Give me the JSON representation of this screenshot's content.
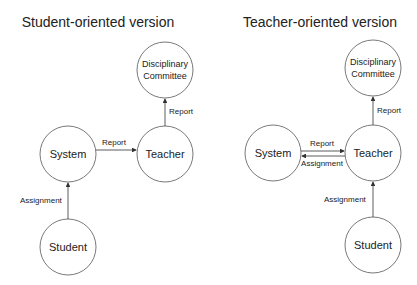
{
  "diagrams": [
    {
      "title": "Student-oriented version",
      "nodes": {
        "disciplinary": {
          "line1": "Disciplinary",
          "line2": "Committee"
        },
        "system": "System",
        "teacher": "Teacher",
        "student": "Student"
      },
      "edges": {
        "teacher_to_disciplinary": "Report",
        "system_to_teacher": "Report",
        "student_to_system": "Assignment"
      }
    },
    {
      "title": "Teacher-oriented version",
      "nodes": {
        "disciplinary": {
          "line1": "Disciplinary",
          "line2": "Committee"
        },
        "system": "System",
        "teacher": "Teacher",
        "student": "Student"
      },
      "edges": {
        "teacher_to_disciplinary": "Report",
        "system_to_teacher": "Report",
        "teacher_to_system": "Assignment",
        "student_to_teacher": "Assignment"
      }
    }
  ]
}
